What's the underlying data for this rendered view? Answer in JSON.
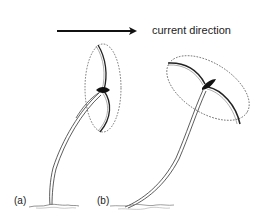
{
  "diagram": {
    "direction_label": "current direction",
    "panels": [
      {
        "id": "a",
        "label": "(a)",
        "description": "upright stalk with vertical fan (closed)"
      },
      {
        "id": "b",
        "label": "(b)",
        "description": "bent stalk with fan tilted by current"
      }
    ],
    "colors": {
      "ink": "#111111",
      "dashed_outline": "#555555",
      "background": "#ffffff"
    }
  }
}
